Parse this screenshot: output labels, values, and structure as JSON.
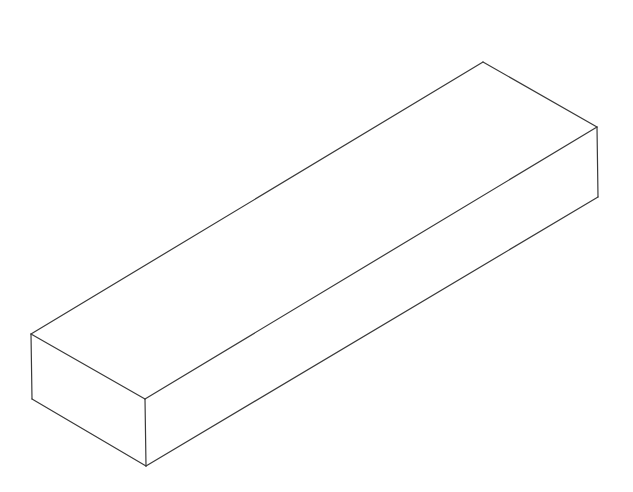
{
  "canvas": {
    "width": 633,
    "height": 492,
    "background_color": "#ffffff"
  },
  "drawing": {
    "title": "isometric-rectangular-bar",
    "type": "wireframe-line-drawing",
    "stroke_color": "#3a3a3a",
    "stroke_width": 1.2,
    "face_fill": "#ffffff",
    "vertices": {
      "left_top": [
        31,
        334
      ],
      "back_top": [
        483,
        62
      ],
      "right_top": [
        597,
        127
      ],
      "front_top": [
        145,
        399
      ],
      "left_bottom": [
        32,
        399
      ],
      "front_bottom": [
        146,
        466
      ],
      "right_bottom": [
        598,
        197
      ]
    },
    "edges": [
      {
        "name": "top-back-long-edge",
        "from": "left_top",
        "to": "back_top"
      },
      {
        "name": "top-right-end-edge",
        "from": "back_top",
        "to": "right_top"
      },
      {
        "name": "top-front-long-edge",
        "from": "front_top",
        "to": "right_top"
      },
      {
        "name": "top-left-end-edge",
        "from": "left_top",
        "to": "front_top"
      },
      {
        "name": "left-vertical-edge",
        "from": "left_top",
        "to": "left_bottom"
      },
      {
        "name": "bottom-left-end-edge",
        "from": "left_bottom",
        "to": "front_bottom"
      },
      {
        "name": "front-vertical-edge",
        "from": "front_top",
        "to": "front_bottom"
      },
      {
        "name": "bottom-front-long-edge",
        "from": "front_bottom",
        "to": "right_bottom"
      },
      {
        "name": "right-vertical-edge",
        "from": "right_top",
        "to": "right_bottom"
      }
    ],
    "visible_faces": [
      "top",
      "left-end",
      "front-long-side"
    ]
  }
}
